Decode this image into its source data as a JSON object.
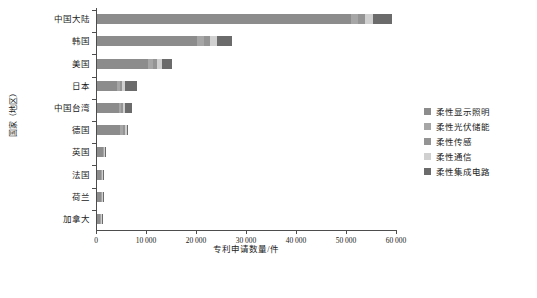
{
  "chart_data": {
    "type": "bar",
    "orientation": "horizontal",
    "stacked": true,
    "title": "",
    "xlabel": "专利申请数量/件",
    "ylabel": "国家（地区）",
    "xlim": [
      0,
      60000
    ],
    "xticks": [
      0,
      10000,
      20000,
      30000,
      40000,
      50000,
      60000
    ],
    "xticklabels": [
      "0",
      "10 000",
      "20 000",
      "30 000",
      "40 000",
      "50 000",
      "60 000"
    ],
    "grid": false,
    "legend_position": "right",
    "categories": [
      "中国大陆",
      "韩国",
      "美国",
      "日本",
      "中国台湾",
      "德国",
      "英国",
      "法国",
      "荷兰",
      "加拿大"
    ],
    "series": [
      {
        "name": "柔性显示照明",
        "color": "#8c8c8c",
        "values": [
          50700,
          19900,
          10100,
          4000,
          4300,
          4500,
          1100,
          700,
          700,
          600
        ]
      },
      {
        "name": "柔性光伏储能",
        "color": "#a6a6a6",
        "values": [
          1500,
          1500,
          1000,
          550,
          500,
          600,
          200,
          200,
          200,
          150
        ]
      },
      {
        "name": "柔性传感",
        "color": "#949494",
        "values": [
          1400,
          1200,
          900,
          500,
          400,
          500,
          150,
          150,
          150,
          100
        ]
      },
      {
        "name": "柔性通信",
        "color": "#d0d0d0",
        "values": [
          1600,
          1300,
          900,
          500,
          350,
          400,
          120,
          120,
          120,
          80
        ]
      },
      {
        "name": "柔性集成电路",
        "color": "#6b6b6b",
        "values": [
          3800,
          3100,
          2100,
          2450,
          1450,
          200,
          130,
          130,
          130,
          70
        ]
      }
    ],
    "totals": [
      59000,
      27000,
      15000,
      8000,
      7000,
      6200,
      1700,
      1300,
      1300,
      1000
    ]
  },
  "legend": {
    "items": [
      {
        "label": "柔性显示照明",
        "color": "#8c8c8c"
      },
      {
        "label": "柔性光伏储能",
        "color": "#a6a6a6"
      },
      {
        "label": "柔性传感",
        "color": "#949494"
      },
      {
        "label": "柔性通信",
        "color": "#d0d0d0"
      },
      {
        "label": "柔性集成电路",
        "color": "#6b6b6b"
      }
    ]
  }
}
